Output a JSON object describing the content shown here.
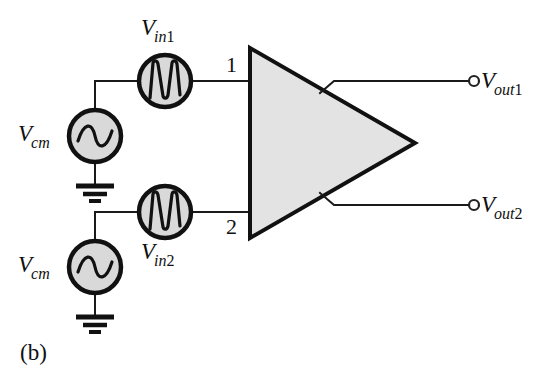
{
  "figure": {
    "caption": "(b)",
    "type": "circuit-schematic"
  },
  "sources": {
    "vcm_top": {
      "label_main": "V",
      "label_sub": "cm",
      "waveform": "sine"
    },
    "vcm_bottom": {
      "label_main": "V",
      "label_sub": "cm",
      "waveform": "sine"
    },
    "vin1": {
      "label_main": "V",
      "label_sub": "in",
      "label_subnum": "1",
      "waveform": "multi-cycle-sine"
    },
    "vin2": {
      "label_main": "V",
      "label_sub": "in",
      "label_subnum": "2",
      "waveform": "multi-cycle-sine"
    }
  },
  "amplifier": {
    "port_top": "1",
    "port_bottom": "2",
    "shape": "triangle",
    "fill_color": "#e3e3e3"
  },
  "outputs": {
    "out1": {
      "label_main": "V",
      "label_sub": "out",
      "label_subnum": "1",
      "terminal": "open-circle"
    },
    "out2": {
      "label_main": "V",
      "label_sub": "out",
      "label_subnum": "2",
      "terminal": "open-circle"
    }
  },
  "grounds": {
    "top": "ground-symbol",
    "bottom": "ground-symbol"
  },
  "colors": {
    "line": "#111111",
    "source_fill": "#d9d9d9",
    "amp_fill": "#e3e3e3",
    "background": "#ffffff"
  }
}
